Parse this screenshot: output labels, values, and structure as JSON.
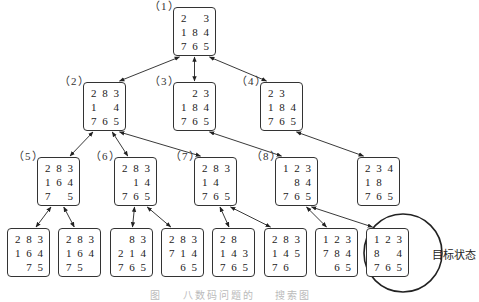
{
  "goal_label": "目标状态",
  "caption": "图    八数码问题的    搜索图",
  "nodes": [
    {
      "id": "n1",
      "label": "（1）",
      "x": 173,
      "y": 7,
      "cells": [
        "2",
        "",
        "3",
        "1",
        "8",
        "4",
        "7",
        "6",
        "5"
      ]
    },
    {
      "id": "n2",
      "label": "（2）",
      "x": 83,
      "y": 82,
      "cells": [
        "2",
        "8",
        "3",
        "1",
        "",
        "4",
        "7",
        "6",
        "5"
      ]
    },
    {
      "id": "n3",
      "label": "（3）",
      "x": 173,
      "y": 82,
      "cells": [
        "",
        "2",
        "3",
        "1",
        "8",
        "4",
        "7",
        "6",
        "5"
      ]
    },
    {
      "id": "n4",
      "label": "（4）",
      "x": 260,
      "y": 82,
      "cells": [
        "2",
        "3",
        "",
        "1",
        "8",
        "4",
        "7",
        "6",
        "5"
      ]
    },
    {
      "id": "n5",
      "label": "（5）",
      "x": 37,
      "y": 157,
      "cells": [
        "2",
        "8",
        "3",
        "1",
        "6",
        "4",
        "7",
        "",
        "5"
      ]
    },
    {
      "id": "n6",
      "label": "（6）",
      "x": 114,
      "y": 157,
      "cells": [
        "2",
        "8",
        "3",
        "",
        "1",
        "4",
        "7",
        "6",
        "5"
      ]
    },
    {
      "id": "n7",
      "label": "（7）",
      "x": 194,
      "y": 157,
      "cells": [
        "2",
        "8",
        "3",
        "1",
        "4",
        "",
        "7",
        "6",
        "5"
      ]
    },
    {
      "id": "n8",
      "label": "（8）",
      "x": 275,
      "y": 157,
      "cells": [
        "1",
        "2",
        "3",
        "",
        "8",
        "4",
        "7",
        "6",
        "5"
      ]
    },
    {
      "id": "n9",
      "label": "",
      "x": 357,
      "y": 157,
      "cells": [
        "2",
        "3",
        "4",
        "1",
        "8",
        "",
        "7",
        "6",
        "5"
      ]
    },
    {
      "id": "b1",
      "label": "",
      "x": 7,
      "y": 228,
      "cells": [
        "2",
        "8",
        "3",
        "1",
        "6",
        "4",
        "",
        "7",
        "5"
      ]
    },
    {
      "id": "b2",
      "label": "",
      "x": 58,
      "y": 228,
      "cells": [
        "2",
        "8",
        "3",
        "1",
        "6",
        "4",
        "7",
        "5",
        ""
      ]
    },
    {
      "id": "b3",
      "label": "",
      "x": 110,
      "y": 228,
      "cells": [
        "",
        "8",
        "3",
        "2",
        "1",
        "4",
        "7",
        "6",
        "5"
      ]
    },
    {
      "id": "b4",
      "label": "",
      "x": 161,
      "y": 228,
      "cells": [
        "2",
        "8",
        "3",
        "7",
        "1",
        "4",
        "",
        "6",
        "5"
      ]
    },
    {
      "id": "b5",
      "label": "",
      "x": 212,
      "y": 228,
      "cells": [
        "2",
        "8",
        "",
        "1",
        "4",
        "3",
        "7",
        "6",
        "5"
      ]
    },
    {
      "id": "b6",
      "label": "",
      "x": 264,
      "y": 228,
      "cells": [
        "2",
        "8",
        "3",
        "1",
        "4",
        "5",
        "7",
        "6",
        ""
      ]
    },
    {
      "id": "b7",
      "label": "",
      "x": 315,
      "y": 228,
      "cells": [
        "1",
        "2",
        "3",
        "7",
        "8",
        "4",
        "",
        "6",
        "5"
      ]
    },
    {
      "id": "b8",
      "label": "",
      "x": 366,
      "y": 228,
      "cells": [
        "1",
        "2",
        "3",
        "8",
        "",
        "4",
        "7",
        "6",
        "5"
      ]
    }
  ],
  "edges": [
    [
      "n1",
      "n2"
    ],
    [
      "n1",
      "n3"
    ],
    [
      "n1",
      "n4"
    ],
    [
      "n2",
      "n5"
    ],
    [
      "n2",
      "n6"
    ],
    [
      "n2",
      "n7"
    ],
    [
      "n3",
      "n8"
    ],
    [
      "n4",
      "n9"
    ],
    [
      "n5",
      "b1"
    ],
    [
      "n5",
      "b2"
    ],
    [
      "n6",
      "b3"
    ],
    [
      "n6",
      "b4"
    ],
    [
      "n7",
      "b5"
    ],
    [
      "n7",
      "b6"
    ],
    [
      "n8",
      "b7"
    ],
    [
      "n8",
      "b8"
    ]
  ],
  "goal": {
    "node": "b8",
    "circle": {
      "cx": 403,
      "cy": 253,
      "r": 39
    }
  }
}
